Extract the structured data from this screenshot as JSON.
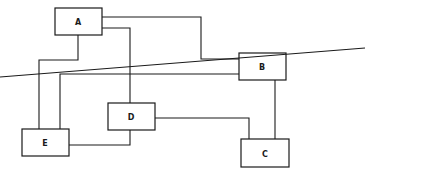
{
  "layout_diagram": {
    "boxes": [
      {
        "id": "A",
        "label": "A"
      },
      {
        "id": "B",
        "label": "B"
      },
      {
        "id": "C",
        "label": "C"
      },
      {
        "id": "D",
        "label": "D"
      },
      {
        "id": "E",
        "label": "E"
      }
    ],
    "connections": [
      [
        "A",
        "B"
      ],
      [
        "A",
        "D"
      ],
      [
        "A",
        "E"
      ],
      [
        "B",
        "E"
      ],
      [
        "B",
        "C"
      ],
      [
        "D",
        "C"
      ],
      [
        "D",
        "E"
      ]
    ]
  },
  "graph": {
    "nodes": [
      {
        "id": "A",
        "label": "A"
      },
      {
        "id": "B",
        "label": "B"
      },
      {
        "id": "C",
        "label": "C"
      },
      {
        "id": "D",
        "label": "D"
      },
      {
        "id": "E",
        "label": "E"
      }
    ],
    "edges": [
      [
        "A",
        "B"
      ],
      [
        "A",
        "E"
      ],
      [
        "A",
        "D"
      ],
      [
        "E",
        "B"
      ],
      [
        "E",
        "D"
      ],
      [
        "B",
        "C"
      ],
      [
        "D",
        "C"
      ]
    ]
  }
}
